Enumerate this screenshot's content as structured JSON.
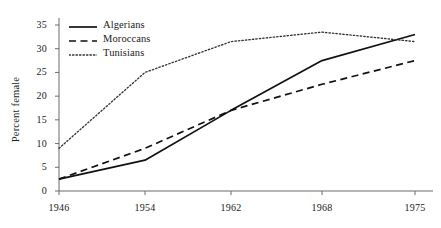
{
  "chart_data": {
    "type": "line",
    "title": "",
    "subtitle": "",
    "xlabel": "",
    "ylabel": "Percent female",
    "x": [
      1946,
      1954,
      1962,
      1968,
      1975
    ],
    "xtick_labels": [
      "1946",
      "1954",
      "1962",
      "1968",
      "1975"
    ],
    "ytick_labels": [
      "0",
      "5",
      "10",
      "15",
      "20",
      "25",
      "30",
      "35"
    ],
    "ytick_values": [
      0,
      5,
      10,
      15,
      20,
      25,
      30,
      35
    ],
    "xlim": [
      1946,
      1975
    ],
    "ylim": [
      0,
      36
    ],
    "grid": false,
    "legend_position": "top-left",
    "series": [
      {
        "name": "Algerians",
        "style": "solid",
        "color": "#111111",
        "values": [
          2.5,
          6.5,
          17.0,
          27.5,
          33.0
        ]
      },
      {
        "name": "Moroccans",
        "style": "dashed",
        "color": "#111111",
        "values": [
          2.5,
          9.0,
          17.0,
          22.5,
          27.5
        ]
      },
      {
        "name": "Tunisians",
        "style": "dotted",
        "color": "#333333",
        "values": [
          9.0,
          25.0,
          31.5,
          33.5,
          31.5
        ]
      }
    ]
  },
  "axes": {
    "y_title": "Percent female"
  },
  "legend": {
    "entries": [
      {
        "label": "Algerians",
        "style": "solid"
      },
      {
        "label": "Moroccans",
        "style": "dashed"
      },
      {
        "label": "Tunisians",
        "style": "dotted"
      }
    ]
  },
  "colors": {
    "ink": "#111111",
    "axis": "#6b6b6b",
    "background": "#ffffff"
  }
}
